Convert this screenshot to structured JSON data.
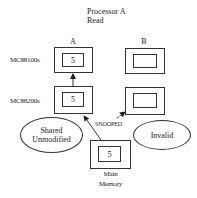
{
  "title": {
    "line1": "Processor A",
    "line2": "Read"
  },
  "columns": {
    "a": "A",
    "b": "B"
  },
  "rows": {
    "processor": "MC88100s",
    "cache": "MC88200s"
  },
  "cells": {
    "a_processor_value": "5",
    "a_cache_value": "5",
    "b_processor_value": "",
    "b_cache_value": "",
    "memory_value": "5"
  },
  "memory": {
    "line1": "Main",
    "line2": "Memory"
  },
  "snoop_label": "SNOOPED",
  "states": {
    "a_state_line1": "Shared",
    "a_state_line2": "Unmodified",
    "b_state": "Invalid"
  },
  "colors": {
    "line": "#333333",
    "background": "#ffffff"
  }
}
